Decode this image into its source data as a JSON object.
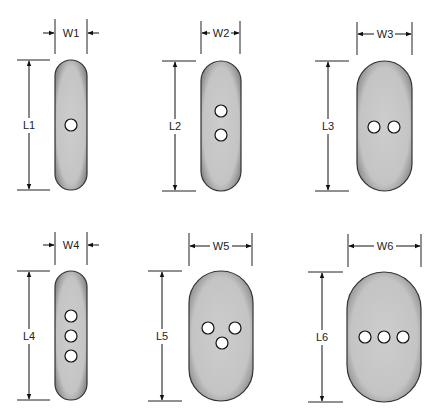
{
  "figure": {
    "fill_color": "#c9c9c9",
    "edge_color": "#333333",
    "hole_color": "#ffffff",
    "shapes": [
      {
        "id": 1,
        "width_label": "W1",
        "length_label": "L1",
        "holes": 1,
        "hole_layout": "single"
      },
      {
        "id": 2,
        "width_label": "W2",
        "length_label": "L2",
        "holes": 2,
        "hole_layout": "vertical pair"
      },
      {
        "id": 3,
        "width_label": "W3",
        "length_label": "L3",
        "holes": 2,
        "hole_layout": "horizontal pair"
      },
      {
        "id": 4,
        "width_label": "W4",
        "length_label": "L4",
        "holes": 3,
        "hole_layout": "vertical row"
      },
      {
        "id": 5,
        "width_label": "W5",
        "length_label": "L5",
        "holes": 3,
        "hole_layout": "triangle"
      },
      {
        "id": 6,
        "width_label": "W6",
        "length_label": "L6",
        "holes": 3,
        "hole_layout": "horizontal row"
      }
    ]
  }
}
